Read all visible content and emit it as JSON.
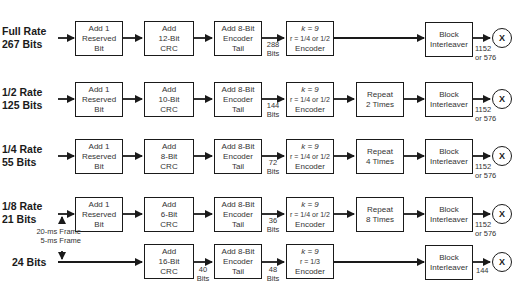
{
  "diagram": {
    "rows": [
      {
        "id": "full-rate",
        "rate_label": "Full Rate\n267 Bits",
        "reserved_bit": "Add 1\nReserved\nBit",
        "crc": "Add\n12-Bit\nCRC",
        "encoder_tail": "Add 8-Bit\nEncoder\nTail",
        "encoder_input_bits": "288\nBits",
        "encoder": {
          "k": "k = 9",
          "r": "r = 1/4 or 1/2",
          "name": "Encoder"
        },
        "repeat": null,
        "interleaver": "Block\nInterleaver",
        "output_bits": "1152\nor 576",
        "multiplier": "X"
      },
      {
        "id": "half-rate",
        "rate_label": "1/2 Rate\n125 Bits",
        "reserved_bit": "Add 1\nReserved\nBit",
        "crc": "Add\n10-Bit\nCRC",
        "encoder_tail": "Add 8-Bit\nEncoder\nTail",
        "encoder_input_bits": "144\nBits",
        "encoder": {
          "k": "k = 9",
          "r": "r = 1/4 or 1/2",
          "name": "Encoder"
        },
        "repeat": "Repeat\n2 Times",
        "interleaver": "Block\nInterleaver",
        "output_bits": "1152\nor 576",
        "multiplier": "X"
      },
      {
        "id": "quarter-rate",
        "rate_label": "1/4 Rate\n55 Bits",
        "reserved_bit": "Add 1\nReserved\nBit",
        "crc": "Add\n8-Bit\nCRC",
        "encoder_tail": "Add 8-Bit\nEncoder\nTail",
        "encoder_input_bits": "72\nBits",
        "encoder": {
          "k": "k = 9",
          "r": "r = 1/4 or 1/2",
          "name": "Encoder"
        },
        "repeat": "Repeat\n4 Times",
        "interleaver": "Block\nInterleaver",
        "output_bits": "1152\nor 576",
        "multiplier": "X"
      },
      {
        "id": "eighth-rate",
        "rate_label": "1/8 Rate\n21 Bits",
        "reserved_bit": "Add 1\nReserved\nBit",
        "crc": "Add\n6-Bit\nCRC",
        "encoder_tail": "Add 8-Bit\nEncoder\nTail",
        "encoder_input_bits": "36\nBits",
        "encoder": {
          "k": "k = 9",
          "r": "r = 1/4 or 1/2",
          "name": "Encoder"
        },
        "repeat": "Repeat\n8 Times",
        "interleaver": "Block\nInterleaver",
        "output_bits": "1152\nor 576",
        "multiplier": "X"
      },
      {
        "id": "24-bits",
        "rate_label": "24 Bits",
        "reserved_bit": null,
        "crc": "Add\n16-Bit\nCRC",
        "crc_output_bits": "40\nBits",
        "encoder_tail": "Add 8-Bit\nEncoder\nTail",
        "encoder_input_bits": "48\nBits",
        "encoder": {
          "k": "k = 9",
          "r": "r = 1/3",
          "name": "Encoder"
        },
        "repeat": null,
        "interleaver": "Block\nInterleaver",
        "output_bits": "144",
        "multiplier": "X"
      }
    ],
    "frame_labels": {
      "top": "20-ms Frame",
      "bottom": "5-ms Frame"
    },
    "colors": {
      "stroke": "#1a1a1a",
      "text": "#333333",
      "background": "#ffffff"
    }
  }
}
